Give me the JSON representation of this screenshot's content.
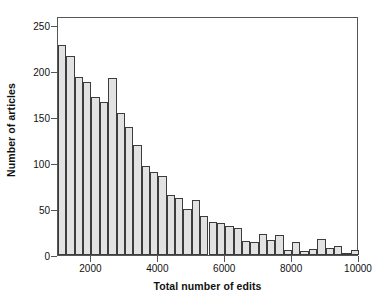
{
  "chart_data": {
    "type": "bar",
    "title": "",
    "subtitle": "",
    "xlabel": "Total number of edits",
    "ylabel": "Number of articles",
    "xlim": [
      1000,
      10000
    ],
    "ylim": [
      0,
      260
    ],
    "grid": false,
    "legend": null,
    "bin_width": 250,
    "x_ticks": [
      2000,
      4000,
      6000,
      8000,
      10000
    ],
    "x_tick_labels": [
      "2000",
      "4000",
      "6000",
      "8000",
      "10000"
    ],
    "y_ticks": [
      0,
      50,
      100,
      150,
      200,
      250
    ],
    "y_tick_labels": [
      "0",
      "50",
      "100",
      "150",
      "200",
      "250"
    ],
    "bar_fill_color": "#e2e2e2",
    "bar_edge_color": "#3c3c3c",
    "axis_color": "#555555",
    "bin_starts": [
      1000,
      1250,
      1500,
      1750,
      2000,
      2250,
      2500,
      2750,
      3000,
      3250,
      3500,
      3750,
      4000,
      4250,
      4500,
      4750,
      5000,
      5250,
      5500,
      5750,
      6000,
      6250,
      6500,
      6750,
      7000,
      7250,
      7500,
      7750,
      8000,
      8250,
      8500,
      8750,
      9000,
      9250,
      9500,
      9750
    ],
    "categories": [
      "1000-1250",
      "1250-1500",
      "1500-1750",
      "1750-2000",
      "2000-2250",
      "2250-2500",
      "2500-2750",
      "2750-3000",
      "3000-3250",
      "3250-3500",
      "3500-3750",
      "3750-4000",
      "4000-4250",
      "4250-4500",
      "4500-4750",
      "4750-5000",
      "5000-5250",
      "5250-5500",
      "5500-5750",
      "5750-6000",
      "6000-6250",
      "6250-6500",
      "6500-6750",
      "6750-7000",
      "7000-7250",
      "7250-7500",
      "7500-7750",
      "7750-8000",
      "8000-8250",
      "8250-8500",
      "8500-8750",
      "8750-9000",
      "9000-9250",
      "9250-9500",
      "9500-9750",
      "9750-10000"
    ],
    "values": [
      228,
      216,
      194,
      188,
      172,
      166,
      193,
      155,
      139,
      120,
      97,
      90,
      86,
      65,
      62,
      50,
      60,
      42,
      36,
      35,
      32,
      29,
      15,
      14,
      23,
      16,
      22,
      6,
      14,
      4,
      7,
      17,
      8,
      10,
      2,
      5
    ]
  }
}
